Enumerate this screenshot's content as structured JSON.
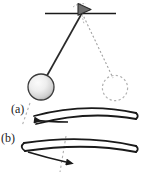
{
  "figure": {
    "background_color": "#ffffff",
    "stroke_color": "#1a1a1a",
    "dash_color": "#9a9a9a",
    "bob_fill_light": "#f2f2f2",
    "bob_fill_dark": "#b8b8b8",
    "pivot_fill": "#6e6e6e"
  },
  "labels": {
    "a": "(a)",
    "b": "(b)"
  },
  "elements": {
    "ceiling_line": "ceiling-line",
    "pivot_marker": "pivot-triangle-marker",
    "string_solid": "pendulum-string-solid",
    "string_dashed": "pendulum-string-dashed",
    "bob_solid": "pendulum-bob",
    "bob_dashed": "pendulum-bob-ghost",
    "curve_a": "curved-arrow-band-a",
    "curve_b": "curved-arrow-band-b",
    "dashed_reference_a": "dashed-reference-line-a",
    "dashed_reference_b": "dashed-reference-line-b"
  },
  "geometry": {
    "pivot": {
      "x": 82,
      "y": 13
    },
    "bob_center": {
      "x": 41,
      "y": 87
    },
    "bob_radius": 13,
    "ghost_center": {
      "x": 115,
      "y": 88
    },
    "ghost_radius": 13,
    "ceiling": {
      "x1": 45,
      "x2": 116,
      "y": 13
    },
    "arrow_a_direction": "left",
    "arrow_b_direction": "right"
  }
}
